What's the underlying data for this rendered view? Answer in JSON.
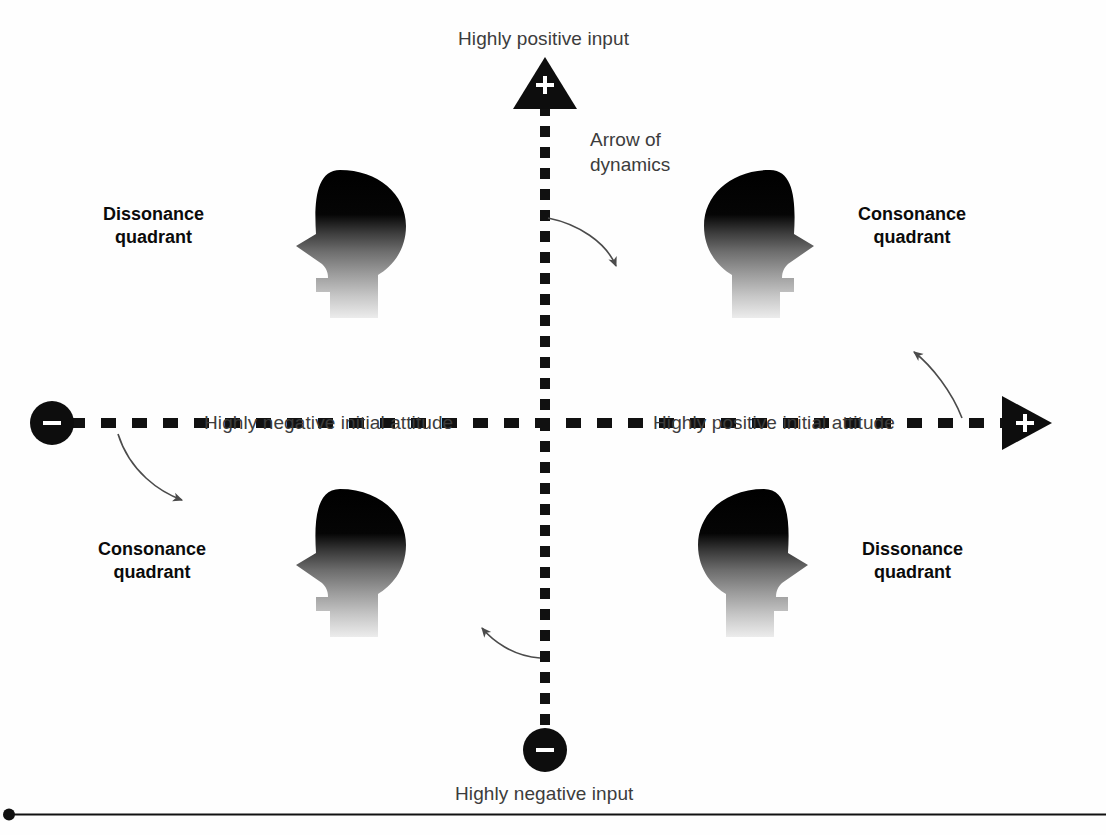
{
  "diagram": {
    "background_color": "#fefefe",
    "axis_color": "#111111",
    "label_color": "#3c3c3c",
    "quadrant_label_color": "#0b0b0b"
  },
  "axes": {
    "vertical": {
      "name": "input",
      "positive_end_label": "Highly positive input",
      "negative_end_label": "Highly negative input",
      "positive_end_sign": "+",
      "negative_end_sign": "−",
      "positive_end_marker": "triangle-up",
      "negative_end_marker": "circle",
      "style": "dashed"
    },
    "horizontal": {
      "name": "initial attitude",
      "negative_end_label": "Highly negative initial attitude",
      "positive_end_label": "Highly positive initial attitude",
      "negative_end_sign": "−",
      "positive_end_sign": "+",
      "negative_end_marker": "circle",
      "positive_end_marker": "triangle-right",
      "style": "dashed"
    }
  },
  "annotations": {
    "dynamics_caption_line1": "Arrow of",
    "dynamics_caption_line2": "dynamics",
    "curved_arrow_count": 4
  },
  "quadrants": [
    {
      "position": "top-left",
      "label_line1": "Dissonance",
      "label_line2": "quadrant",
      "icon": "head-silhouette-facing-left"
    },
    {
      "position": "top-right",
      "label_line1": "Consonance",
      "label_line2": "quadrant",
      "icon": "head-silhouette-facing-right"
    },
    {
      "position": "bottom-left",
      "label_line1": "Consonance",
      "label_line2": "quadrant",
      "icon": "head-silhouette-facing-left"
    },
    {
      "position": "bottom-right",
      "label_line1": "Dissonance",
      "label_line2": "quadrant",
      "icon": "head-silhouette-facing-right"
    }
  ],
  "footer": {
    "rule_marker": "bullet-dot",
    "rule_description": "horizontal rule"
  }
}
